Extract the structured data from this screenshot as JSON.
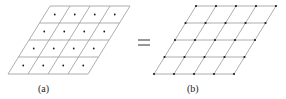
{
  "figure": {
    "panels": [
      {
        "id": "a",
        "label": "(a)",
        "rows": 4,
        "cols": 4,
        "corners": {
          "tl": [
            50,
            6
          ],
          "tr": [
            130,
            6
          ],
          "bl": [
            8,
            74
          ],
          "br": [
            88,
            74
          ]
        },
        "dots": "cell-centers"
      },
      {
        "id": "b",
        "label": "(b)",
        "rows": 4,
        "cols": 4,
        "corners": {
          "tl": [
            196,
            6
          ],
          "tr": [
            276,
            6
          ],
          "bl": [
            154,
            74
          ],
          "br": [
            234,
            74
          ]
        },
        "dots": "vertices"
      }
    ],
    "operator": "=",
    "colors": {
      "line": "#9a9a9a",
      "dot": "#1a1a1a",
      "text": "#222222"
    }
  }
}
